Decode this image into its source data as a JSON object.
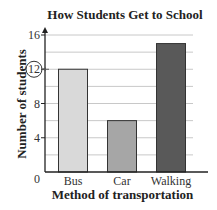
{
  "chart_data": {
    "type": "bar",
    "title": "How Students Get to School",
    "xlabel": "Method of transportation",
    "ylabel": "Number of students",
    "categories": [
      "Bus",
      "Car",
      "Walking"
    ],
    "values": [
      12,
      6,
      15
    ],
    "ylim": [
      0,
      16
    ],
    "yticks": [
      0,
      4,
      8,
      12,
      16
    ],
    "grid": true,
    "legend": null,
    "annotations": [
      {
        "type": "circle",
        "target": "ytick",
        "value": 12,
        "arrow_to_axis": true
      }
    ],
    "bar_colors": [
      "#d9d9d9",
      "#a6a6a6",
      "#595959"
    ]
  }
}
